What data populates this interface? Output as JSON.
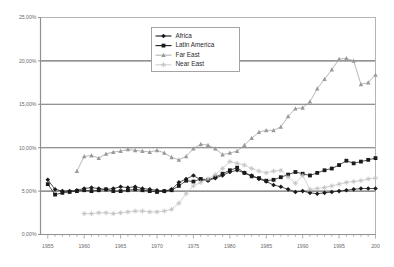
{
  "chart_data": {
    "type": "line",
    "title": "",
    "xlabel": "",
    "ylabel": "",
    "xlim": [
      1954,
      2000
    ],
    "ylim": [
      0,
      25
    ],
    "grid": true,
    "y_ticks": [
      0,
      5,
      10,
      15,
      20,
      25
    ],
    "y_tick_labels": [
      "0,00%",
      "5,00%",
      "10,00%",
      "15,00%",
      "20,00%",
      "25,00%"
    ],
    "x_ticks": [
      1955,
      1960,
      1965,
      1970,
      1975,
      1980,
      1985,
      1990,
      1995,
      2000
    ],
    "x_tick_labels": [
      "1955",
      "1960",
      "1965",
      "1970",
      "1975",
      "1980",
      "1985",
      "1990",
      "1995",
      "200"
    ],
    "legend_position": "top-center",
    "series": [
      {
        "name": "Africa",
        "color": "#1a1a1a",
        "marker": "diamond",
        "x": [
          1955,
          1956,
          1957,
          1958,
          1959,
          1960,
          1961,
          1962,
          1963,
          1964,
          1965,
          1966,
          1967,
          1968,
          1969,
          1970,
          1971,
          1972,
          1973,
          1974,
          1975,
          1976,
          1977,
          1978,
          1979,
          1980,
          1981,
          1982,
          1983,
          1984,
          1985,
          1986,
          1987,
          1988,
          1989,
          1990,
          1991,
          1992,
          1993,
          1994,
          1995,
          1996,
          1997,
          1998,
          1999,
          2000
        ],
        "values": [
          6.3,
          5.2,
          5.0,
          5.0,
          5.1,
          5.3,
          5.4,
          5.3,
          5.2,
          5.3,
          5.5,
          5.4,
          5.5,
          5.3,
          5.2,
          5.1,
          5.0,
          5.2,
          6.0,
          6.4,
          6.8,
          6.3,
          6.2,
          6.5,
          6.8,
          7.2,
          7.4,
          7.1,
          6.8,
          6.4,
          6.1,
          5.7,
          5.5,
          5.2,
          4.9,
          5.0,
          4.8,
          4.7,
          4.8,
          4.9,
          5.0,
          5.1,
          5.2,
          5.3,
          5.3,
          5.3
        ]
      },
      {
        "name": "Latin America",
        "color": "#1a1a1a",
        "marker": "square",
        "x": [
          1955,
          1956,
          1957,
          1958,
          1959,
          1960,
          1961,
          1962,
          1963,
          1964,
          1965,
          1966,
          1967,
          1968,
          1969,
          1970,
          1971,
          1972,
          1973,
          1974,
          1975,
          1976,
          1977,
          1978,
          1979,
          1980,
          1981,
          1982,
          1983,
          1984,
          1985,
          1986,
          1987,
          1988,
          1989,
          1990,
          1991,
          1992,
          1993,
          1994,
          1995,
          1996,
          1997,
          1998,
          1999,
          2000
        ],
        "values": [
          5.8,
          4.6,
          4.8,
          4.9,
          5.0,
          5.1,
          5.0,
          5.1,
          5.2,
          5.0,
          5.0,
          5.1,
          5.2,
          5.1,
          5.0,
          4.9,
          5.0,
          5.1,
          5.6,
          6.2,
          6.1,
          6.4,
          6.3,
          6.6,
          7.0,
          7.4,
          7.7,
          7.1,
          6.7,
          6.5,
          6.2,
          6.3,
          6.6,
          6.9,
          7.2,
          7.0,
          6.8,
          7.1,
          7.4,
          7.6,
          8.0,
          8.5,
          8.2,
          8.4,
          8.6,
          8.8
        ]
      },
      {
        "name": "Far East",
        "color": "#9a9a9a",
        "marker": "triangle",
        "x": [
          1959,
          1960,
          1961,
          1962,
          1963,
          1964,
          1965,
          1966,
          1967,
          1968,
          1969,
          1970,
          1971,
          1972,
          1973,
          1974,
          1975,
          1976,
          1977,
          1978,
          1979,
          1980,
          1981,
          1982,
          1983,
          1984,
          1985,
          1986,
          1987,
          1988,
          1989,
          1990,
          1991,
          1992,
          1993,
          1994,
          1995,
          1996,
          1997,
          1998,
          1999,
          2000
        ],
        "values": [
          7.3,
          9.0,
          9.1,
          8.8,
          9.3,
          9.5,
          9.6,
          9.8,
          9.7,
          9.6,
          9.5,
          9.7,
          9.4,
          8.9,
          8.6,
          9.0,
          9.9,
          10.4,
          10.3,
          9.9,
          9.2,
          9.4,
          9.6,
          10.3,
          11.1,
          11.8,
          12.0,
          12.0,
          12.4,
          13.6,
          14.5,
          14.6,
          15.3,
          16.8,
          17.9,
          19.0,
          20.2,
          20.3,
          20.0,
          17.3,
          17.5,
          18.4
        ]
      },
      {
        "name": "Near East",
        "color": "#c0c0c0",
        "marker": "star",
        "x": [
          1960,
          1961,
          1962,
          1963,
          1964,
          1965,
          1966,
          1967,
          1968,
          1969,
          1970,
          1971,
          1972,
          1973,
          1974,
          1975,
          1976,
          1977,
          1978,
          1979,
          1980,
          1981,
          1982,
          1983,
          1984,
          1985,
          1986,
          1987,
          1988,
          1989,
          1990,
          1991,
          1992,
          1993,
          1994,
          1995,
          1996,
          1997,
          1998,
          1999,
          2000
        ],
        "values": [
          2.4,
          2.4,
          2.5,
          2.5,
          2.4,
          2.5,
          2.6,
          2.7,
          2.7,
          2.6,
          2.6,
          2.7,
          2.9,
          3.6,
          4.7,
          5.6,
          6.0,
          6.4,
          6.9,
          7.6,
          8.4,
          8.2,
          8.0,
          7.6,
          7.3,
          7.1,
          7.3,
          7.4,
          6.6,
          5.9,
          6.8,
          5.2,
          5.3,
          5.4,
          5.6,
          5.8,
          6.0,
          6.1,
          6.2,
          6.4,
          6.5
        ]
      }
    ]
  },
  "legend": {
    "items": [
      {
        "label": "Africa"
      },
      {
        "label": "Latin America"
      },
      {
        "label": "Far East"
      },
      {
        "label": "Near East"
      }
    ]
  },
  "colors": {
    "plot_border": "#8a8a8a",
    "gridline": "#6f6f6f",
    "background": "#ffffff",
    "axis_text": "#6b6b6b"
  }
}
